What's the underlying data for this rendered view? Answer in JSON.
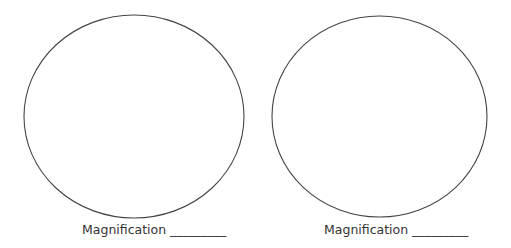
{
  "worksheet": {
    "fields": [
      {
        "label": "Magnification",
        "blank": "_________"
      },
      {
        "label": "Magnification",
        "blank": "_________"
      }
    ]
  },
  "colors": {
    "outline": "#444444",
    "text": "#333333",
    "background": "#ffffff"
  }
}
